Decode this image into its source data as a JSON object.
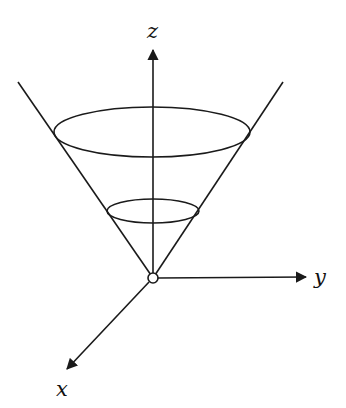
{
  "diagram": {
    "axes": {
      "z": {
        "label": "z"
      },
      "y": {
        "label": "y"
      },
      "x": {
        "label": "x"
      }
    },
    "origin": {
      "marker": "open-circle"
    },
    "cross_sections": [
      {
        "name": "upper-circle"
      },
      {
        "name": "lower-circle"
      }
    ],
    "colors": {
      "stroke": "#1a1a1a",
      "background": "#ffffff"
    }
  }
}
